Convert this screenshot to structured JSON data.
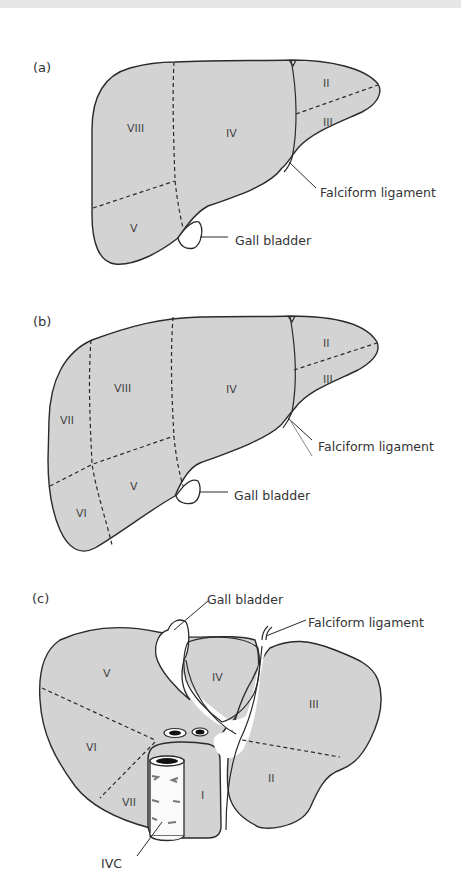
{
  "figure": {
    "panels": [
      {
        "id": "a",
        "label": "(a)",
        "segments": [
          "II",
          "III",
          "IV",
          "V",
          "VIII"
        ],
        "annotations": {
          "falciform": "Falciform ligament",
          "gallbladder": "Gall bladder"
        }
      },
      {
        "id": "b",
        "label": "(b)",
        "segments": [
          "II",
          "III",
          "IV",
          "V",
          "VI",
          "VII",
          "VIII"
        ],
        "annotations": {
          "falciform": "Falciform ligament",
          "gallbladder": "Gall bladder"
        }
      },
      {
        "id": "c",
        "label": "(c)",
        "segments": [
          "I",
          "II",
          "III",
          "IV",
          "V",
          "VI",
          "VII"
        ],
        "annotations": {
          "gallbladder": "Gall bladder",
          "falciform": "Falciform ligament",
          "ivc": "IVC"
        }
      }
    ]
  },
  "colors": {
    "liver_fill": "#d3d3d3",
    "outline": "#2a2a2a",
    "background": "#ffffff"
  }
}
